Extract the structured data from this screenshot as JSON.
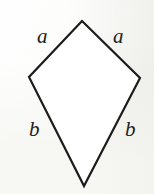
{
  "figure": {
    "name": "kite-quadrilateral",
    "background_color": "#f6f6f4",
    "stroke_color": "#1d1c1b",
    "fill_color": "#ffffff",
    "stroke_width": 2.2,
    "vertices": {
      "top": [
        82,
        21
      ],
      "left": [
        29,
        77
      ],
      "right": [
        140,
        78
      ],
      "bottom": [
        84,
        186
      ]
    },
    "polygon_points": "82,21 140,78 84,186 29,77",
    "labels": {
      "a_left": "a",
      "a_right": "a",
      "b_left": "b",
      "b_right": "b"
    },
    "label_style": {
      "font_style": "italic",
      "font_size_px": 21,
      "color": "#201f1e"
    }
  }
}
